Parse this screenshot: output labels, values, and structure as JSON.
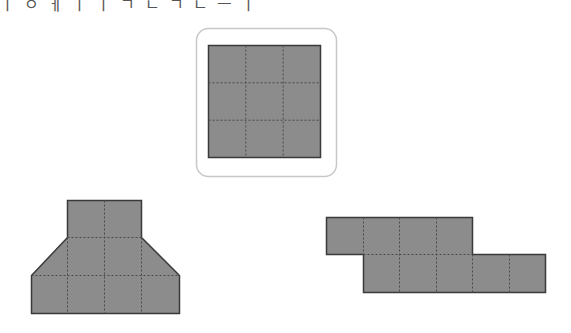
{
  "header": {
    "partial_text": "ㅣ ㅇ ㅔ ㅣ ㅣ ㄱ ㄴ ㄱ ㄴ ㅡ ㅣ"
  },
  "colors": {
    "fill": "#8c8c8c",
    "stroke": "#3a3a3a",
    "dash": "#4a4a4a",
    "frame": "#c8c8c8"
  },
  "figures": {
    "reference": {
      "label": "reference-square-3x3",
      "rows": 3,
      "cols": 3,
      "framed": true
    },
    "shape_a": {
      "label": "trapezoid-net",
      "description": "2 squares on top, 4-wide trapezoid middle row, 4-square bottom row"
    },
    "shape_b": {
      "label": "stepped-strip",
      "top_row_squares": 4,
      "bottom_row_squares": 5
    }
  }
}
